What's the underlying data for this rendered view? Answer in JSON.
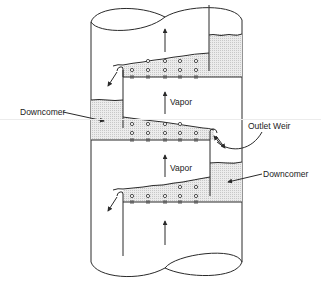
{
  "diagram": {
    "labels": {
      "vapor_upper": "Vapor",
      "vapor_lower": "Vapor",
      "downcomer_left": "Downcomer",
      "downcomer_right": "Downcomer",
      "outlet_weir": "Outlet Weir"
    },
    "colors": {
      "line": "#2a2a2a",
      "liquid_fill": "#e4e4e4",
      "background": "#ffffff"
    },
    "trays": [
      {
        "name": "upper-tray",
        "y": 77,
        "downcomer_side": "right",
        "outlet_side": "left"
      },
      {
        "name": "middle-tray",
        "y": 140,
        "downcomer_side": "left",
        "outlet_side": "right"
      },
      {
        "name": "lower-tray",
        "y": 202,
        "downcomer_side": "right",
        "outlet_side": "left"
      }
    ],
    "holes_per_row": 5
  }
}
